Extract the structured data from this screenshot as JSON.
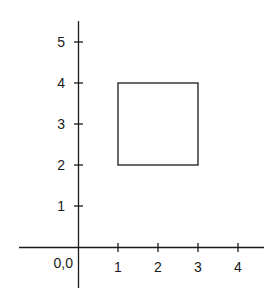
{
  "diagram": {
    "type": "coordinate-plane",
    "origin_label": "0,0",
    "x_axis": {
      "ticks": [
        "1",
        "2",
        "3",
        "4"
      ]
    },
    "y_axis": {
      "ticks": [
        "1",
        "2",
        "3",
        "4",
        "5"
      ]
    },
    "shapes": [
      {
        "kind": "square",
        "x_min": 1,
        "x_max": 3,
        "y_min": 2,
        "y_max": 4
      }
    ]
  }
}
